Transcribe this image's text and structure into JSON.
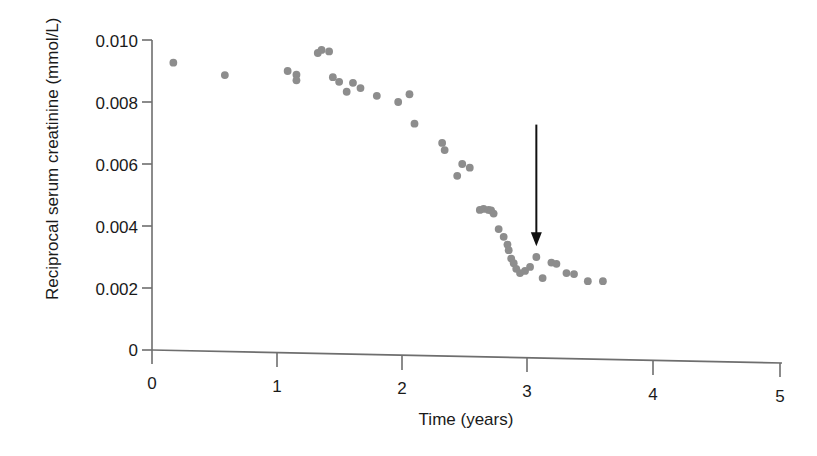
{
  "figure": {
    "background_color": "#ffffff",
    "dot_color": "#8d8d8d",
    "axis_color": "#6e6e6e",
    "text_color": "#1a1a1a",
    "arrow_color": "#111111"
  },
  "chart_data": {
    "type": "scatter",
    "title": "",
    "xlabel": "Time (years)",
    "ylabel": "Reciprocal serum creatinine (mmol/L)",
    "xlim": [
      0,
      5
    ],
    "ylim": [
      0,
      0.0113
    ],
    "xticks": [
      0,
      1,
      2,
      3,
      4,
      5
    ],
    "xtick_labels": [
      "0",
      "1",
      "2",
      "3",
      "4",
      "5"
    ],
    "yticks": [
      0,
      0.002,
      0.004,
      0.006,
      0.008,
      0.01
    ],
    "ytick_labels": [
      "0",
      "0.002",
      "0.004",
      "0.006",
      "0.008",
      "0.010"
    ],
    "grid": false,
    "legend": false,
    "series": [
      {
        "name": "Reciprocal serum creatinine",
        "marker": "circle",
        "color": "#8d8d8d",
        "points": [
          [
            0.17,
            0.00927
          ],
          [
            0.58,
            0.00887
          ],
          [
            1.08,
            0.009
          ],
          [
            1.15,
            0.00888
          ],
          [
            1.15,
            0.0087
          ],
          [
            1.32,
            0.00958
          ],
          [
            1.35,
            0.00968
          ],
          [
            1.41,
            0.00963
          ],
          [
            1.44,
            0.0088
          ],
          [
            1.49,
            0.00865
          ],
          [
            1.55,
            0.00833
          ],
          [
            1.6,
            0.00862
          ],
          [
            1.66,
            0.00845
          ],
          [
            1.79,
            0.0082
          ],
          [
            1.96,
            0.008
          ],
          [
            2.05,
            0.00825
          ],
          [
            2.09,
            0.0073
          ],
          [
            2.31,
            0.00668
          ],
          [
            2.33,
            0.00645
          ],
          [
            2.47,
            0.006
          ],
          [
            2.53,
            0.00588
          ],
          [
            2.43,
            0.00562
          ],
          [
            2.61,
            0.00452
          ],
          [
            2.64,
            0.00455
          ],
          [
            2.68,
            0.00452
          ],
          [
            2.7,
            0.0045
          ],
          [
            2.72,
            0.0044
          ],
          [
            2.76,
            0.0039
          ],
          [
            2.8,
            0.00365
          ],
          [
            2.83,
            0.0034
          ],
          [
            2.84,
            0.00322
          ],
          [
            2.86,
            0.00295
          ],
          [
            2.88,
            0.0028
          ],
          [
            2.9,
            0.00262
          ],
          [
            2.93,
            0.00248
          ],
          [
            2.97,
            0.00255
          ],
          [
            3.01,
            0.00268
          ],
          [
            3.06,
            0.003
          ],
          [
            3.11,
            0.00232
          ],
          [
            3.18,
            0.00282
          ],
          [
            3.22,
            0.00278
          ],
          [
            3.3,
            0.00248
          ],
          [
            3.36,
            0.00245
          ],
          [
            3.47,
            0.00222
          ],
          [
            3.59,
            0.00222
          ]
        ]
      }
    ],
    "annotations": [
      {
        "kind": "arrow",
        "label": "",
        "points_to_x": 3.06,
        "points_to_y": 0.00335,
        "tail_y": 0.0054
      }
    ]
  }
}
